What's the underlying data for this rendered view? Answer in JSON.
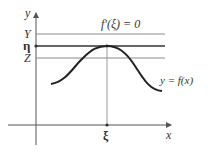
{
  "diagram": {
    "y_axis_label": "y",
    "x_axis_label": "x",
    "level_labels": {
      "upper": "Y",
      "mid": "η",
      "lower": "Z"
    },
    "derivative_label": "f′(ξ) = 0",
    "curve_label": "y = f(x)",
    "xi_label": "ξ",
    "colors": {
      "axis": "#555555",
      "curve": "#222222",
      "line": "#888888",
      "eta_line": "#333333"
    }
  }
}
